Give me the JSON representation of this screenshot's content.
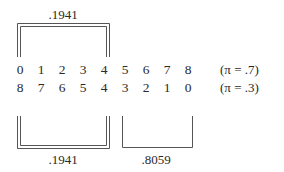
{
  "diagram": {
    "rows": [
      {
        "digits": [
          "0",
          "1",
          "2",
          "3",
          "4",
          "5",
          "6",
          "7",
          "8"
        ],
        "label": "(π = .7)"
      },
      {
        "digits": [
          "8",
          "7",
          "6",
          "5",
          "4",
          "3",
          "2",
          "1",
          "0"
        ],
        "label": "(π = .3)"
      }
    ],
    "brackets": {
      "top_left": {
        "label": ".1941",
        "spans": "columns 0-4 of row 1",
        "style": "double"
      },
      "bottom_left": {
        "label": ".1941",
        "spans": "columns 0-4 of row 2",
        "style": "double"
      },
      "bottom_right": {
        "label": ".8059",
        "spans": "columns 5-8 of row 2",
        "style": "single"
      }
    }
  }
}
